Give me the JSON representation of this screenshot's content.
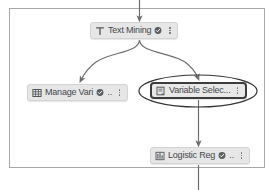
{
  "canvas": {
    "title": "workflow-canvas",
    "background_color": "#ffffff",
    "border_color": "#a8a8a8",
    "edge_color": "#6e6e6e",
    "node_fill": "#e6e6e6",
    "node_text_color": "#44484c",
    "selection_border_color": "#3c3c3c",
    "annotation_color": "#333333"
  },
  "nodes": [
    {
      "id": "text-mining",
      "label": "Text Mining",
      "icon": "text-t-icon",
      "status_badge": "check-circle-icon",
      "menu": "kebab-menu-icon",
      "selected": false,
      "truncated": false
    },
    {
      "id": "manage-variables",
      "label": "Manage Vari",
      "icon": "table-grid-icon",
      "status_badge": "check-circle-icon",
      "ellipsis": "..",
      "menu": "kebab-menu-icon",
      "selected": false,
      "truncated": true
    },
    {
      "id": "variable-selection",
      "label": "Variable Selec...",
      "icon": "form-document-icon",
      "menu": "kebab-menu-icon",
      "selected": true,
      "truncated": true
    },
    {
      "id": "logistic-regression",
      "label": "Logistic Reg",
      "icon": "bar-chart-icon",
      "status_badge": "check-circle-icon",
      "ellipsis": "..",
      "menu": "kebab-menu-icon",
      "selected": false,
      "truncated": true
    }
  ],
  "edges": [
    {
      "id": "edge-in-top",
      "from": "above-canvas",
      "to": "text-mining",
      "style": "straight-arrow"
    },
    {
      "id": "edge-textmining-managevariables",
      "from": "text-mining",
      "to": "manage-variables",
      "style": "curved-arrow"
    },
    {
      "id": "edge-textmining-variableselection",
      "from": "text-mining",
      "to": "variable-selection",
      "style": "curved-arrow"
    },
    {
      "id": "edge-variableselection-logisticregression",
      "from": "variable-selection",
      "to": "logistic-regression",
      "style": "straight-arrow"
    },
    {
      "id": "edge-out-bottom",
      "from": "logistic-regression",
      "to": "below-canvas",
      "style": "straight-line"
    }
  ],
  "annotation": {
    "id": "highlight-ellipse",
    "target": "variable-selection",
    "shape": "ellipse"
  }
}
